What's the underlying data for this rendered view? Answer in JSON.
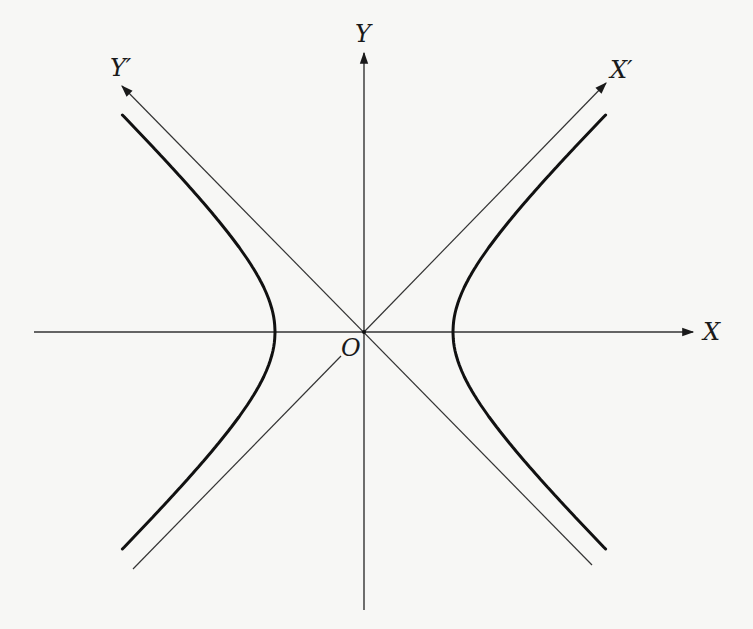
{
  "diagram": {
    "colors": {
      "background": "#f7f7f5",
      "ink": "#1a1a1a",
      "thin_line": "#333333"
    },
    "labels": {
      "x_axis": "X",
      "y_axis": "Y",
      "x_prime": "X′",
      "y_prime": "Y′",
      "origin": "O"
    },
    "geometry": {
      "origin_px": [
        364,
        332
      ],
      "vertex_left_px": [
        275,
        332
      ],
      "vertex_right_px": [
        454,
        332
      ],
      "semi_axis_a_px": 89,
      "semi_axis_b_px": 86,
      "x_axis_from_px": [
        34,
        332
      ],
      "x_axis_to_px": [
        693,
        332
      ],
      "y_axis_from_px": [
        364,
        610
      ],
      "y_axis_to_px": [
        364,
        53
      ],
      "asymptote_x_prime_from_px": [
        133,
        569
      ],
      "asymptote_x_prime_to_px": [
        606,
        83
      ],
      "asymptote_x_prime_gap_near_origin": [
        [
          341,
          356
        ],
        [
          364,
          332
        ]
      ],
      "asymptote_y_prime_from_px": [
        592,
        565
      ],
      "asymptote_y_prime_to_px": [
        122,
        86
      ],
      "curve_y_range_px": [
        115,
        550
      ]
    },
    "elements": [
      {
        "name": "x-axis",
        "arrow": true,
        "label": "X"
      },
      {
        "name": "y-axis",
        "arrow": true,
        "label": "Y"
      },
      {
        "name": "x-prime-asymptote",
        "arrow": true,
        "label": "X′"
      },
      {
        "name": "y-prime-asymptote",
        "arrow": true,
        "label": "Y′"
      },
      {
        "name": "hyperbola-left-branch",
        "arrow": false
      },
      {
        "name": "hyperbola-right-branch",
        "arrow": false
      }
    ]
  }
}
